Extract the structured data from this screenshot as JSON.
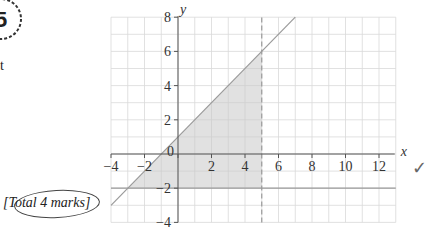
{
  "badge": {
    "grade": "5",
    "ring_text": "GRADE"
  },
  "fragment_text": "t",
  "total_marks": "[Total 4 marks]",
  "check_mark": "✓",
  "chart_data": {
    "type": "line",
    "title": "",
    "xlabel": "x",
    "ylabel": "y",
    "xlim": [
      -4,
      13
    ],
    "ylim": [
      -4,
      8
    ],
    "x_ticks": [
      -4,
      -2,
      0,
      2,
      4,
      6,
      8,
      10,
      12
    ],
    "y_ticks": [
      -4,
      -2,
      2,
      4,
      6,
      8
    ],
    "origin_label": "0",
    "grid": true,
    "lines": [
      {
        "name": "y = x + 1",
        "style": "solid",
        "points": [
          [
            -4,
            -3
          ],
          [
            7,
            8
          ]
        ]
      },
      {
        "name": "y = -2",
        "style": "solid",
        "points": [
          [
            -4,
            -2
          ],
          [
            13,
            -2
          ]
        ]
      },
      {
        "name": "x = 5",
        "style": "dashed",
        "points": [
          [
            5,
            -4
          ],
          [
            5,
            8
          ]
        ]
      }
    ],
    "shaded_region": {
      "description": "triangle region bounded by y=x+1, y=-2, x=5",
      "vertices": [
        [
          -3,
          -2
        ],
        [
          5,
          -2
        ],
        [
          5,
          6
        ]
      ]
    },
    "colors": {
      "grid": "#d9d9d9",
      "axis": "#555555",
      "line": "#9a9a9a",
      "shade": "#c8c8c8"
    }
  }
}
